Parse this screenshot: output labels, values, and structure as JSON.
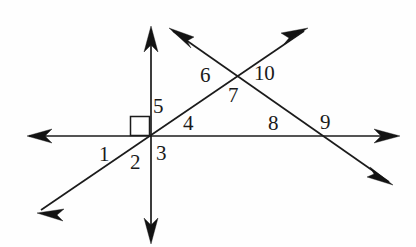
{
  "figure": {
    "background_color": "#fefefe",
    "line_color": "#1b1b1b",
    "label_color": "#1a1a1a",
    "canvas": {
      "width": 416,
      "height": 247
    }
  },
  "lines": [
    {
      "name": "vertical-line",
      "x1": 151,
      "y1": 30,
      "x2": 151,
      "y2": 240,
      "arrow_start": true,
      "arrow_end": true
    },
    {
      "name": "horizontal-line",
      "x1": 29,
      "y1": 136,
      "x2": 397,
      "y2": 136,
      "arrow_start": true,
      "arrow_end": true
    },
    {
      "name": "rising-diagonal-line",
      "x1": 41,
      "y1": 210,
      "x2": 304,
      "y2": 31,
      "arrow_start": true,
      "arrow_end": true
    },
    {
      "name": "falling-diagonal-line",
      "x1": 173,
      "y1": 31,
      "x2": 389,
      "y2": 182,
      "arrow_start": true,
      "arrow_end": true
    }
  ],
  "right_angle_mark": {
    "name": "right-angle-square",
    "x": 130,
    "y": 116,
    "size": 19
  },
  "intersections": [
    {
      "name": "origin-intersection",
      "x": 151,
      "y": 136
    },
    {
      "name": "diagonal-cross-intersection",
      "x": 240,
      "y": 74
    },
    {
      "name": "falling-diagonal-horizontal-intersection",
      "x": 325,
      "y": 136
    }
  ],
  "labels": [
    {
      "id": "label-1",
      "text": "1",
      "x": 99,
      "y": 144
    },
    {
      "id": "label-2",
      "text": "2",
      "x": 130,
      "y": 152
    },
    {
      "id": "label-3",
      "text": "3",
      "x": 156,
      "y": 143
    },
    {
      "id": "label-4",
      "text": "4",
      "x": 183,
      "y": 113
    },
    {
      "id": "label-5",
      "text": "5",
      "x": 153,
      "y": 96
    },
    {
      "id": "label-6",
      "text": "6",
      "x": 200,
      "y": 65
    },
    {
      "id": "label-7",
      "text": "7",
      "x": 228,
      "y": 85
    },
    {
      "id": "label-8",
      "text": "8",
      "x": 268,
      "y": 113
    },
    {
      "id": "label-9",
      "text": "9",
      "x": 320,
      "y": 112
    },
    {
      "id": "label-10",
      "text": "10",
      "x": 254,
      "y": 63
    }
  ]
}
